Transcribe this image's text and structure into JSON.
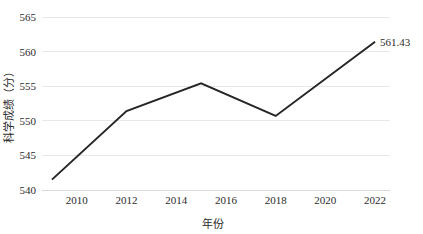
{
  "chart_data": {
    "type": "line",
    "title": "",
    "xlabel": "年份",
    "ylabel": "科学成绩（分）",
    "xlim": [
      2008.6,
      2022.6
    ],
    "ylim": [
      540,
      565
    ],
    "grid": true,
    "legend": "none",
    "x": [
      2009,
      2012,
      2015,
      2018,
      2022
    ],
    "values": [
      541.5,
      551.4,
      555.4,
      550.7,
      561.43
    ],
    "series": [
      {
        "name": "科学成绩",
        "color": "#262626",
        "values": [
          541.5,
          551.4,
          555.4,
          550.7,
          561.43
        ]
      }
    ],
    "xticks": [
      "2010",
      "2012",
      "2014",
      "2016",
      "2018",
      "2020",
      "2022"
    ],
    "xtick_values": [
      2010,
      2012,
      2014,
      2016,
      2018,
      2020,
      2022
    ],
    "yticks": [
      "540",
      "545",
      "550",
      "555",
      "560",
      "565"
    ],
    "ytick_values": [
      540,
      545,
      550,
      555,
      560,
      565
    ],
    "annotations": [
      {
        "text": "561.43",
        "x": 2022,
        "y": 561.43
      }
    ]
  }
}
